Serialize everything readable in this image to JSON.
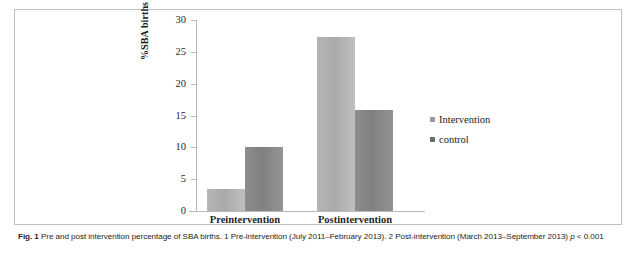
{
  "figure": {
    "caption_label": "Fig. 1",
    "caption_text": " Pre and post intervention percentage of SBA births. 1 Pre-intervention (July 2011–February 2013). 2 Post-intervention (March 2013–September 2013) ",
    "caption_pvalue_italic": "p",
    "caption_pvalue_rest": " < 0.001"
  },
  "chart_data": {
    "type": "bar",
    "title": "",
    "xlabel": "",
    "ylabel": "%SBA births / total births",
    "categories": [
      "Preintervention",
      "Postintervention"
    ],
    "series": [
      {
        "name": "Intervention",
        "values": [
          3.5,
          27.3
        ],
        "color": "#b0b0b0"
      },
      {
        "name": "control",
        "values": [
          10.1,
          15.9
        ],
        "color": "#878787"
      }
    ],
    "ylim": [
      0,
      30
    ],
    "yticks": [
      0,
      5,
      10,
      15,
      20,
      25,
      30
    ],
    "ytick_labels": [
      "0",
      "5",
      "10",
      "15",
      "20",
      "25",
      "30"
    ],
    "grid": false,
    "legend_position": "right"
  },
  "legend": {
    "items": [
      {
        "label": "Intervention",
        "swatch": "legend-swatch-intervention"
      },
      {
        "label": "control",
        "swatch": "legend-swatch-control"
      }
    ]
  }
}
